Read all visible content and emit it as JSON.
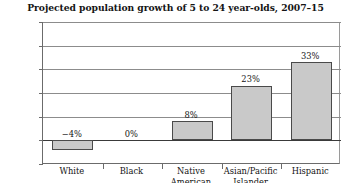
{
  "chart_data": {
    "type": "bar",
    "title": "Projected population growth of 5 to 24 year-olds, 2007–15",
    "xlabel": "",
    "ylabel": "",
    "categories": [
      "White",
      "Black",
      "Native American",
      "Asian/Pacific Islander",
      "Hispanic"
    ],
    "category_label_lines": [
      [
        "White"
      ],
      [
        "Black"
      ],
      [
        "Native",
        "American"
      ],
      [
        "Asian/Pacific",
        "Islander"
      ],
      [
        "Hispanic"
      ]
    ],
    "values": [
      -4,
      0,
      8,
      23,
      33
    ],
    "value_labels": [
      "−4%",
      "0%",
      "8%",
      "23%",
      "33%"
    ],
    "ylim": [
      -10,
      50
    ],
    "ytick_values": [
      50,
      40,
      30,
      20,
      10,
      0,
      -10
    ],
    "ytick_labels": [
      "50%",
      "40%",
      "30%",
      "20%",
      "10%",
      "0%",
      "−10%"
    ],
    "grid": true,
    "grid_axis": "y",
    "legend": "none",
    "bar_fill_color": "#c9c9c9",
    "bar_border_color": "#4a4a4a",
    "zero_line_color": "#3a3a3a",
    "grid_color": "#8c8c8c",
    "background_color": "#ffffff",
    "text_color": "#141414"
  }
}
